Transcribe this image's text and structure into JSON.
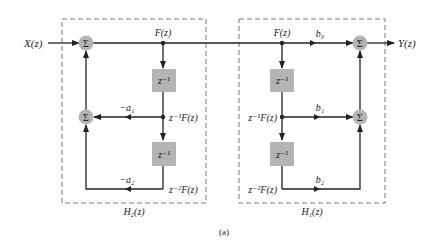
{
  "diagram": {
    "caption": "(a)",
    "input_label": "X(z)",
    "output_label": "Y(z)",
    "sum_symbol": "Σ",
    "delay_label": "z⁻¹",
    "left_block": {
      "label": "H₂(z)",
      "node_labels": [
        "F(z)",
        "z⁻¹F(z)",
        "z⁻²F(z)"
      ],
      "gains": [
        "−a₁",
        "−a₂"
      ]
    },
    "right_block": {
      "label": "H₁(z)",
      "node_labels": [
        "F(z)",
        "z⁻¹F(z)",
        "z⁻²F(z)"
      ],
      "gains": [
        "b₀",
        "b₁",
        "b₂"
      ]
    },
    "colors": {
      "line": "#222222",
      "sum_fill": "#b4b4b4",
      "delay_fill": "#b4b4b4",
      "dash": "#777777"
    }
  }
}
